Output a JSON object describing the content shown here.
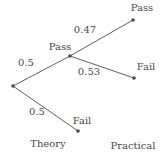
{
  "diagram": {
    "type": "probability-tree",
    "stage_labels": {
      "first": "Theory",
      "second": "Practical"
    },
    "nodes": {
      "theory_pass": "Pass",
      "theory_fail": "Fail",
      "practical_pass": "Pass",
      "practical_fail": "Fail"
    },
    "probabilities": {
      "theory_pass": "0.5",
      "theory_fail": "0.5",
      "practical_pass": "0.47",
      "practical_fail": "0.53"
    },
    "colors": {
      "line": "#5f5f5f",
      "node": "#4a4a4a",
      "text": "#4d4844",
      "background": "#ffffff"
    }
  }
}
